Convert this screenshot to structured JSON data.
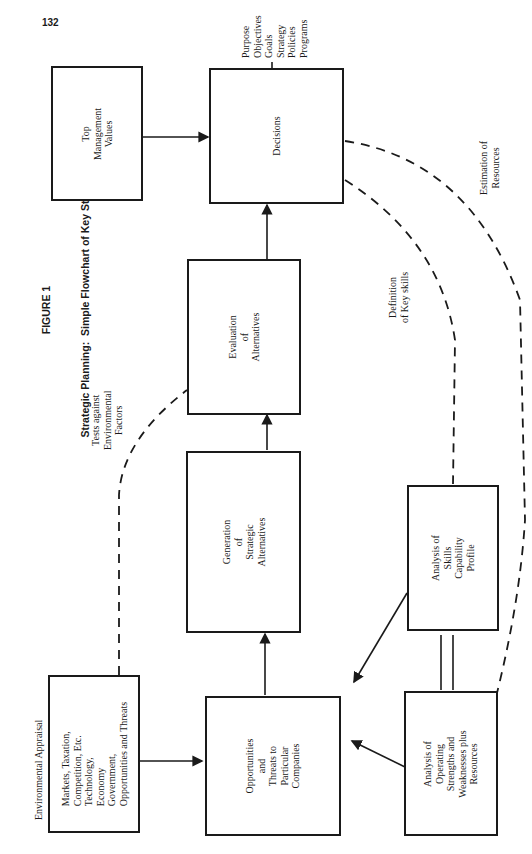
{
  "page": {
    "number": "132"
  },
  "figure": {
    "label": "FIGURE 1",
    "title": "Strategic Planning:  Simple Flowchart of Key Steps"
  },
  "nodes": {
    "top_management": {
      "text": "Top\nManagement\nValues"
    },
    "decisions": {
      "text": "Decisions"
    },
    "decision_outputs": {
      "text": "Purpose\nObjectives\nGoals\nStrategy\nPolicies\nPrograms"
    },
    "evaluation": {
      "text": "Evaluation\nof\nAlternatives"
    },
    "generation": {
      "text": "Generation\nof\nStrategic\nAlternatives"
    },
    "opportunities": {
      "text": "Opportunities\nand\nThreats to\nParticular\nCompanies"
    },
    "environmental": {
      "caption": "Environmental Appraisal",
      "text": "Markets, Taxation,\nCompetition, Etc.\nTechnology,\nEconomy\nGovernment,\nOpportunities and Threats"
    },
    "skills": {
      "text": "Analysis of\nSkills\nCapability\nProfile"
    },
    "operating": {
      "text": "Analysis of\nOperating\nStrengths and\nWeaknesses plus\nResources"
    }
  },
  "edge_labels": {
    "tests": "Tests against\nEnvironmental\nFactors",
    "key_skills": "Definition\nof Key skills",
    "resources": "Estimation of\nResources"
  },
  "colors": {
    "ink": "#1a1a1a",
    "paper": "#ffffff"
  }
}
